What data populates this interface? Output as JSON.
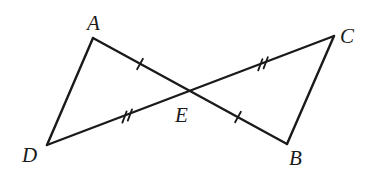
{
  "diagram": {
    "type": "geometry",
    "points": {
      "A": {
        "label": "A",
        "x": 93,
        "y": 38,
        "label_x": 87,
        "label_y": 30
      },
      "B": {
        "label": "B",
        "x": 287,
        "y": 144,
        "label_x": 289,
        "label_y": 165
      },
      "C": {
        "label": "C",
        "x": 334,
        "y": 36,
        "label_x": 340,
        "label_y": 43
      },
      "D": {
        "label": "D",
        "x": 47,
        "y": 145,
        "label_x": 22,
        "label_y": 162
      },
      "E": {
        "label": "E",
        "x": 188,
        "y": 90,
        "label_x": 175,
        "label_y": 122
      }
    },
    "segments": [
      {
        "from": "A",
        "to": "D"
      },
      {
        "from": "A",
        "to": "B"
      },
      {
        "from": "D",
        "to": "C"
      },
      {
        "from": "C",
        "to": "B"
      }
    ],
    "congruence_marks": [
      {
        "segment": "AE",
        "ticks": 1
      },
      {
        "segment": "EB",
        "ticks": 1
      },
      {
        "segment": "DE",
        "ticks": 2
      },
      {
        "segment": "EC",
        "ticks": 2
      }
    ],
    "stroke_color": "#1a1a1a",
    "background": "#ffffff"
  }
}
